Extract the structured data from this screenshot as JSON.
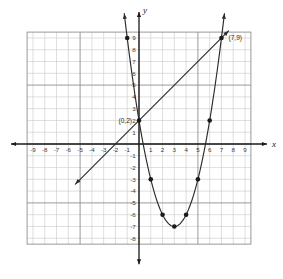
{
  "figure": {
    "axis_labels": {
      "x": "x",
      "y": "y"
    },
    "colors": {
      "grid_minor": "#c9c9c9",
      "grid_major": "#8e8e8e",
      "axis": "#1a1a1a",
      "curve": "#2b2b2b",
      "line": "#2b2b2b",
      "point": "#1a1a1a",
      "background": "#ffffff"
    }
  },
  "chart_data": {
    "type": "line",
    "title": "",
    "xlabel": "x",
    "ylabel": "y",
    "xlim": [
      -9.5,
      9.5
    ],
    "ylim": [
      -8.5,
      9.5
    ],
    "grid": true,
    "legend": "none",
    "xticks": [
      -9,
      -8,
      -7,
      -6,
      -5,
      -4,
      -3,
      -2,
      -1,
      1,
      2,
      3,
      4,
      5,
      6,
      7,
      8,
      9
    ],
    "yticks": [
      9,
      8,
      7,
      6,
      5,
      4,
      3,
      2,
      1,
      -1,
      -2,
      -3,
      -4,
      -5,
      -6,
      -7,
      -8
    ],
    "xtick_labels": [
      "-9",
      "-8",
      "-7",
      "-6",
      "-5",
      "-4",
      "-3",
      "-2",
      "-1",
      "1",
      "2",
      "3",
      "4",
      "5",
      "6",
      "7",
      "8",
      "9"
    ],
    "ytick_labels": [
      "9",
      "8",
      "7",
      "6",
      "5",
      "4",
      "3",
      "2",
      "1",
      "-1",
      "-2",
      "-3",
      "-4",
      "-5",
      "-6",
      "-7",
      "-8"
    ],
    "series": [
      {
        "name": "parabola",
        "equation": "y = x^2 - 6x + 2",
        "type": "curve",
        "x_range": [
          -1.25,
          7.25
        ],
        "arrows": [
          "start",
          "end"
        ],
        "marked_points": [
          {
            "x": -1,
            "y": 9
          },
          {
            "x": 0,
            "y": 2
          },
          {
            "x": 1,
            "y": -3
          },
          {
            "x": 2,
            "y": -6
          },
          {
            "x": 3,
            "y": -7
          },
          {
            "x": 4,
            "y": -6
          },
          {
            "x": 5,
            "y": -3
          },
          {
            "x": 6,
            "y": 2
          },
          {
            "x": 7,
            "y": 9
          }
        ]
      },
      {
        "name": "line",
        "equation": "y = x + 2",
        "type": "line",
        "x_range": [
          -5.4,
          7.6
        ],
        "arrows": [
          "start",
          "end"
        ],
        "marked_points": [
          {
            "x": 0,
            "y": 2
          },
          {
            "x": 7,
            "y": 9
          }
        ]
      }
    ],
    "annotations": [
      {
        "label": "(0,2)",
        "x": 0,
        "y": 2,
        "placement": "left"
      },
      {
        "label": "(7,9)",
        "x": 7,
        "y": 9,
        "placement": "right"
      }
    ],
    "intersections": [
      {
        "x": 0,
        "y": 2,
        "label": "(0,2)"
      },
      {
        "x": 7,
        "y": 9,
        "label": "(7,9)"
      }
    ]
  }
}
